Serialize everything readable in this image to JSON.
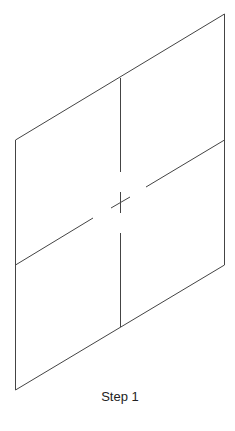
{
  "diagram": {
    "caption": "Step 1",
    "stroke_color": "#444444",
    "shape": "parallelogram divided into four quadrants with center cross mark",
    "outline": {
      "top_left": [
        15,
        140
      ],
      "top_right": [
        224,
        14
      ],
      "bottom_right": [
        225,
        265
      ],
      "bottom_left": [
        16,
        390
      ]
    },
    "center_mark": [
      120,
      202
    ]
  }
}
